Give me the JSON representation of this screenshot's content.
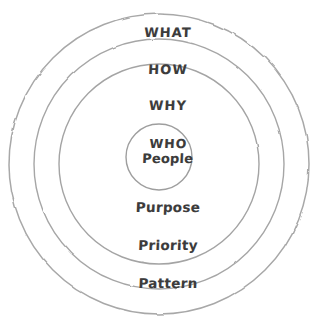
{
  "diagram": {
    "type": "concentric-circles",
    "title": "",
    "background_color": "#ffffff",
    "stroke_color": "#a3a3a3",
    "text_color": "#3c3c3c",
    "center": {
      "x": 159,
      "y": 164
    },
    "rings": [
      {
        "index": 1,
        "name": "outer-ring",
        "radius": 150,
        "upper_label": "WHAT",
        "lower_label": "Pattern"
      },
      {
        "index": 2,
        "name": "second-ring",
        "radius": 125,
        "upper_label": "HOW",
        "lower_label": "Priority"
      },
      {
        "index": 3,
        "name": "third-ring",
        "radius": 100,
        "upper_label": "WHY",
        "lower_label": "Purpose"
      },
      {
        "index": 4,
        "name": "core-circle",
        "radius": 33,
        "upper_label": "WHO",
        "lower_label": "People"
      }
    ],
    "labels": {
      "what": "WHAT",
      "how": "HOW",
      "why": "WHY",
      "who": "WHO",
      "people": "People",
      "purpose": "Purpose",
      "priority": "Priority",
      "pattern": "Pattern"
    }
  }
}
